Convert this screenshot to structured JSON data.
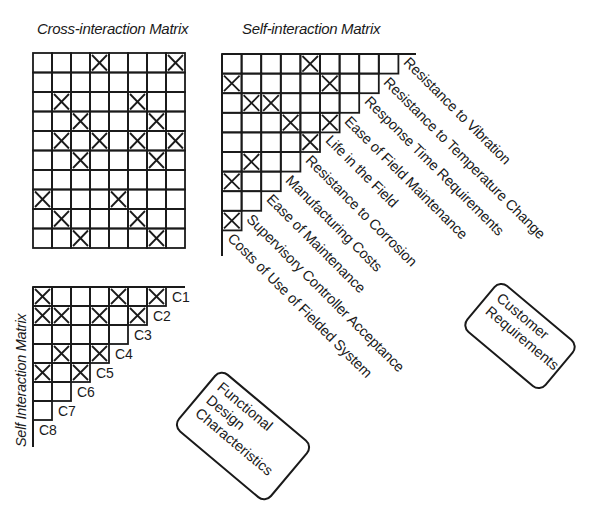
{
  "titles": {
    "cross": "Cross-interaction Matrix",
    "self_top": "Self-interaction Matrix",
    "self_left": "Self Interaction Matrix"
  },
  "cross_matrix": {
    "cols": 8,
    "rows": 10,
    "marks": [
      [
        0,
        3
      ],
      [
        0,
        7
      ],
      [
        2,
        1
      ],
      [
        2,
        5
      ],
      [
        3,
        2
      ],
      [
        3,
        6
      ],
      [
        4,
        1
      ],
      [
        4,
        3
      ],
      [
        4,
        5
      ],
      [
        4,
        7
      ],
      [
        5,
        2
      ],
      [
        5,
        6
      ],
      [
        7,
        0
      ],
      [
        7,
        4
      ],
      [
        8,
        1
      ],
      [
        8,
        5
      ],
      [
        9,
        2
      ],
      [
        9,
        6
      ]
    ]
  },
  "customer_self_matrix": {
    "row_lengths": [
      9,
      8,
      7,
      6,
      5,
      4,
      3,
      2,
      1
    ],
    "marks": [
      [
        0,
        4
      ],
      [
        1,
        0
      ],
      [
        1,
        5
      ],
      [
        2,
        1
      ],
      [
        2,
        2
      ],
      [
        3,
        3
      ],
      [
        3,
        5
      ],
      [
        4,
        4
      ],
      [
        5,
        1
      ],
      [
        6,
        0
      ],
      [
        8,
        0
      ]
    ]
  },
  "customer_requirements": [
    "Resistance to Vibration",
    "Resistance to Temperature Change",
    "Response Time Requirements",
    "Ease of Field Maintenance",
    "Life in the Field",
    "Resistance to Corrosion",
    "Manufacturing Costs",
    "Ease of Maintenance",
    "Supervisory Controller Acceptance",
    "Costs of Use of Fielded System"
  ],
  "design_self_matrix": {
    "row_lengths": [
      7,
      6,
      5,
      4,
      3,
      2,
      1
    ],
    "marks": [
      [
        0,
        0
      ],
      [
        0,
        4
      ],
      [
        0,
        6
      ],
      [
        1,
        0
      ],
      [
        1,
        1
      ],
      [
        1,
        3
      ],
      [
        1,
        5
      ],
      [
        3,
        1
      ],
      [
        3,
        3
      ],
      [
        4,
        0
      ],
      [
        4,
        2
      ]
    ]
  },
  "design_characteristics": [
    "C1",
    "C2",
    "C3",
    "C4",
    "C5",
    "C6",
    "C7",
    "C8"
  ],
  "boxes": {
    "customer": [
      "Customer",
      "Requirements"
    ],
    "functional": [
      "Functional",
      "Design",
      "Characteristics"
    ]
  }
}
